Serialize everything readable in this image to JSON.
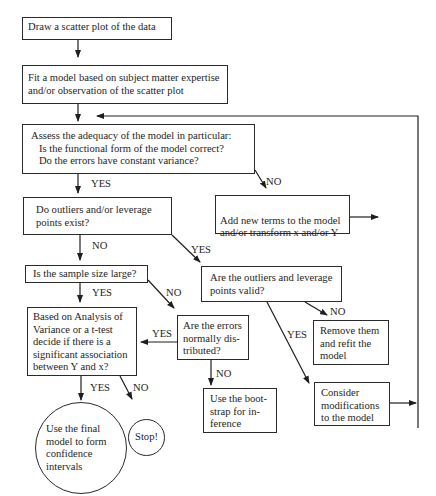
{
  "diagram": {
    "type": "flowchart",
    "nodes": {
      "draw_scatter": "Draw a scatter plot of the data",
      "fit_model": "Fit a model based on subject matter expertise\nand/or observation of the scatter plot",
      "assess_adequacy": "Assess the adequacy of the model in particular:\n   Is the functional form of the model correct?\n   Do the errors have constant variance?",
      "outliers_exist": "Do outliers and/or leverage\npoints exist?",
      "add_terms": "Add new terms to the model\nand/or transform x and/or Y",
      "sample_large": "Is the sample size large?",
      "outliers_valid": "Are the outliers and leverage\npoints valid?",
      "anova_ttest": "Based on Analysis of\nVariance or a t-test\ndecide if there is a\nsignificant association\nbetween Y and x?",
      "errors_normal": "Are the errors\nnormally dis-\ntributed?",
      "remove_refit": "Remove them\nand refit the\nmodel",
      "bootstrap": "Use the boot-\nstrap for in-\nference",
      "consider_mods": "Consider\nmodifications\nto the model",
      "final_model": "Use the final\nmodel to form\nconfidence\nintervals",
      "stop": "Stop!"
    },
    "edge_labels": {
      "assess_yes": "YES",
      "assess_no": "NO",
      "outliers_no": "NO",
      "outliers_yes": "YES",
      "sample_yes": "YES",
      "sample_no": "NO",
      "valid_no": "NO",
      "valid_yes": "YES",
      "normal_yes": "YES",
      "normal_no": "NO",
      "anova_yes": "YES",
      "anova_no": "NO"
    },
    "edges": [
      {
        "from": "draw_scatter",
        "to": "fit_model",
        "label": ""
      },
      {
        "from": "fit_model",
        "to": "assess_adequacy",
        "label": ""
      },
      {
        "from": "assess_adequacy",
        "to": "outliers_exist",
        "label": "YES"
      },
      {
        "from": "assess_adequacy",
        "to": "add_terms",
        "label": "NO"
      },
      {
        "from": "add_terms",
        "to": "assess_adequacy",
        "label": ""
      },
      {
        "from": "outliers_exist",
        "to": "sample_large",
        "label": "NO"
      },
      {
        "from": "outliers_exist",
        "to": "outliers_valid",
        "label": "YES"
      },
      {
        "from": "sample_large",
        "to": "anova_ttest",
        "label": "YES"
      },
      {
        "from": "sample_large",
        "to": "errors_normal",
        "label": "NO"
      },
      {
        "from": "outliers_valid",
        "to": "remove_refit",
        "label": "NO"
      },
      {
        "from": "outliers_valid",
        "to": "consider_mods",
        "label": "YES"
      },
      {
        "from": "errors_normal",
        "to": "anova_ttest",
        "label": "YES"
      },
      {
        "from": "errors_normal",
        "to": "bootstrap",
        "label": "NO"
      },
      {
        "from": "anova_ttest",
        "to": "final_model",
        "label": "YES"
      },
      {
        "from": "anova_ttest",
        "to": "stop",
        "label": "NO"
      },
      {
        "from": "consider_mods",
        "to": "assess_adequacy",
        "label": ""
      }
    ]
  }
}
